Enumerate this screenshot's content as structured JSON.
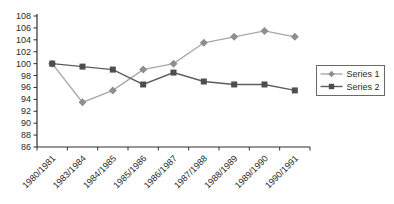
{
  "chart_data": {
    "type": "line",
    "title": "",
    "xlabel": "",
    "ylabel": "",
    "categories": [
      "1980/1981",
      "1983/1984",
      "1984/1985",
      "1985/1986",
      "1986/1987",
      "1987/1988",
      "1988/1989",
      "1989/1990",
      "1990/1991"
    ],
    "series": [
      {
        "name": "Series 1",
        "marker": "diamond",
        "marker_color": "#8e8e8e",
        "line_color": "#a8a8a8",
        "values": [
          100,
          93.5,
          95.5,
          99,
          100,
          103.5,
          104.5,
          105.5,
          104.5
        ]
      },
      {
        "name": "Series 2",
        "marker": "square",
        "marker_color": "#4e4e4e",
        "line_color": "#5e5e5e",
        "values": [
          100,
          99.5,
          99,
          96.5,
          98.5,
          97,
          96.5,
          96.5,
          95.5
        ]
      }
    ],
    "ylim": [
      86,
      108
    ],
    "y_ticks": [
      86,
      88,
      90,
      92,
      94,
      96,
      98,
      100,
      102,
      104,
      106,
      108
    ],
    "x_tick_label_rotation": -45,
    "grid": false,
    "legend_position": "right",
    "legend_border_color": "#6a6a6a",
    "axis_color": "#2f2f2f",
    "text_color": "#2b2b2b",
    "background_color": "#ffffff"
  }
}
